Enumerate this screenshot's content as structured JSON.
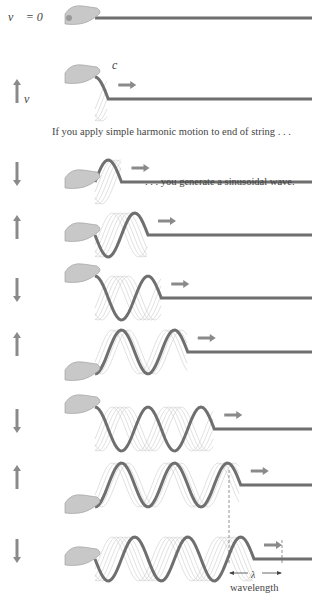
{
  "labels": {
    "v_eq_zero": "v⃗ = 0⃗",
    "v": "v⃗",
    "c": "c⃗",
    "caption_top": "If you apply simple harmonic motion to end of string . . .",
    "caption_mid": ". . . you generate a sinusoidal wave.",
    "lambda": "λ",
    "wavelength": "wavelength"
  },
  "colors": {
    "string": "#6f6f6f",
    "arrow": "#8a8a8a",
    "hand": "#c8c8c8",
    "ghost": "#c4c4c4"
  },
  "rows": [
    {
      "y": 18,
      "velocity": "zero",
      "waves": 0
    },
    {
      "y": 77,
      "velocity": "up",
      "waves": 0.25
    },
    {
      "y": 160,
      "velocity": "down",
      "waves": 0.5
    },
    {
      "y": 213,
      "velocity": "up",
      "waves": 1.0
    },
    {
      "y": 276,
      "velocity": "down",
      "waves": 1.25
    },
    {
      "y": 330,
      "velocity": "up",
      "waves": 1.75
    },
    {
      "y": 407,
      "velocity": "down",
      "waves": 2.25
    },
    {
      "y": 463,
      "velocity": "up",
      "waves": 2.75
    },
    {
      "y": 537,
      "velocity": "down",
      "waves": 3.0
    }
  ]
}
